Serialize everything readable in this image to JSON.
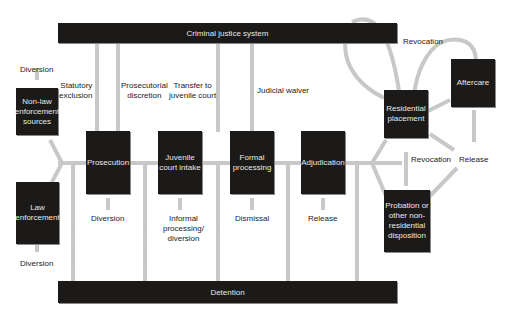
{
  "colors": {
    "box": "#1c1a18",
    "box_text": "#e8e8e8",
    "connector": "#c8c8c8",
    "arrow": "#1a1a1a",
    "background": "#ffffff"
  },
  "bars": {
    "top": "Criminal justice system",
    "bottom": "Detention"
  },
  "boxes": {
    "non_law": "Non-law enforcement sources",
    "non_law_lines": [
      "Non-law",
      "enforcement",
      "sources"
    ],
    "law": [
      "Law",
      "enforcement"
    ],
    "prosecution": [
      "Prosecution"
    ],
    "intake": [
      "Juvenile",
      "court intake"
    ],
    "formal": [
      "Formal",
      "processing"
    ],
    "adjudication": [
      "Adjudication"
    ],
    "residential": [
      "Residential",
      "placement"
    ],
    "aftercare": [
      "Aftercare"
    ],
    "probation": [
      "Probation or",
      "other non-",
      "residential",
      "disposition"
    ]
  },
  "labels": {
    "diversion_top": "Diversion",
    "statutory": [
      "Statutory",
      "exclusion"
    ],
    "prosecutorial": [
      "Prosecutorial",
      "discretion"
    ],
    "transfer": [
      "Transfer to",
      "juvenile court"
    ],
    "judicial": "Judicial waiver",
    "diversion_prosecution": "Diversion",
    "informal": [
      "Informal",
      "processing/",
      "diversion"
    ],
    "dismissal": "Dismissal",
    "release_adj": "Release",
    "diversion_law": "Diversion",
    "revocation_top": "Revocation",
    "revocation_mid": "Revocation",
    "release_right": "Release"
  }
}
